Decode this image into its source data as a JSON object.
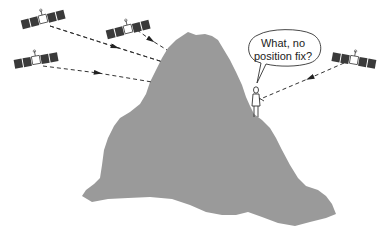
{
  "diagram": {
    "speech_bubble": {
      "line1": "What, no",
      "line2": "position fix?"
    },
    "elements": {
      "satellites": 4,
      "mountain": "grey terrain obstruction",
      "person": "GPS receiver user on mountain ledge",
      "signal_paths": 4
    },
    "colors": {
      "mountain": "#9a9a9a",
      "solar_panel": "#3a3a3a",
      "line": "#333333",
      "background": "#ffffff"
    }
  }
}
